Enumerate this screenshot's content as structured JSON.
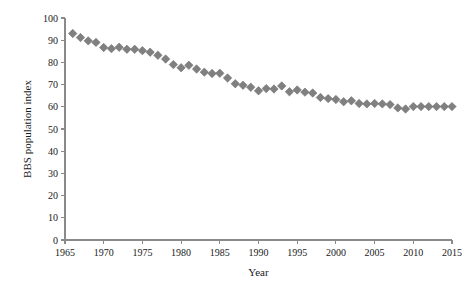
{
  "chart_data": {
    "type": "scatter",
    "title": "",
    "xlabel": "Year",
    "ylabel": "BBS population index",
    "xlim": [
      1965,
      2015
    ],
    "ylim": [
      0,
      100
    ],
    "grid": false,
    "legend": null,
    "marker": {
      "shape": "diamond",
      "color": "#808080",
      "edge_color": "#6e6e6e"
    },
    "xticks": [
      1965,
      1970,
      1975,
      1980,
      1985,
      1990,
      1995,
      2000,
      2005,
      2010,
      2015
    ],
    "xtick_labels": [
      "1965",
      "1970",
      "1975",
      "1980",
      "1985",
      "1990",
      "1995",
      "2000",
      "2005",
      "2010",
      "2015"
    ],
    "yticks": [
      0,
      10,
      20,
      30,
      40,
      50,
      60,
      70,
      80,
      90,
      100
    ],
    "ytick_labels": [
      "0",
      "10",
      "20",
      "30",
      "40",
      "50",
      "60",
      "70",
      "80",
      "90",
      "100"
    ],
    "x": [
      1966,
      1967,
      1968,
      1969,
      1970,
      1971,
      1972,
      1973,
      1974,
      1975,
      1976,
      1977,
      1978,
      1979,
      1980,
      1981,
      1982,
      1983,
      1984,
      1985,
      1986,
      1987,
      1988,
      1989,
      1990,
      1991,
      1992,
      1993,
      1994,
      1995,
      1996,
      1997,
      1998,
      1999,
      2000,
      2001,
      2002,
      2003,
      2004,
      2005,
      2006,
      2007,
      2008,
      2009,
      2010,
      2011,
      2012,
      2013,
      2014,
      2015
    ],
    "values": [
      93.0,
      91.2,
      89.7,
      89.0,
      86.7,
      86.2,
      86.8,
      85.9,
      85.9,
      85.3,
      84.6,
      83.2,
      81.5,
      79.0,
      77.6,
      78.7,
      77.0,
      75.6,
      75.0,
      75.1,
      73.0,
      70.4,
      69.7,
      68.8,
      67.2,
      68.2,
      68.0,
      69.4,
      66.8,
      67.6,
      66.6,
      66.2,
      64.2,
      63.7,
      63.3,
      62.3,
      62.7,
      61.5,
      61.3,
      61.5,
      61.3,
      61.0,
      59.5,
      59.0,
      60.1,
      60.1,
      60.1,
      60.1,
      60.1,
      60.1
    ],
    "series_name": "BBS population index"
  },
  "labels": {
    "x_axis_title": "Year",
    "y_axis_title": "BBS population index"
  }
}
